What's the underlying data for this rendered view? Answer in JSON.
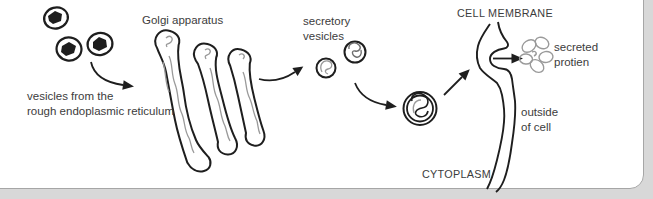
{
  "theme": {
    "page_bg": "#d8d8d8",
    "figure_bg": "#ffffff",
    "border": "#a6a6a6",
    "ink": "#1e1e1e",
    "squiggle": "#9a9a9a",
    "text": "#3c3c3c"
  },
  "labels": {
    "rer": {
      "line1": "vesicles from the",
      "line2": "rough endoplasmic reticulum"
    },
    "golgi": "Golgi apparatus",
    "secretory": {
      "line1": "secretory",
      "line2": "vesicles"
    },
    "cell_membrane": "CELL MEMBRANE",
    "secreted": {
      "line1": "secreted",
      "line2": "protien"
    },
    "outside": {
      "line1": "outside",
      "line2": "of cell"
    },
    "cytoplasm": "CYTOPLASM"
  },
  "process_flow": [
    "vesicles from the rough endoplasmic reticulum",
    "Golgi apparatus",
    "secretory vesicles",
    "CELL MEMBRANE",
    "secreted protien",
    "outside of cell"
  ]
}
